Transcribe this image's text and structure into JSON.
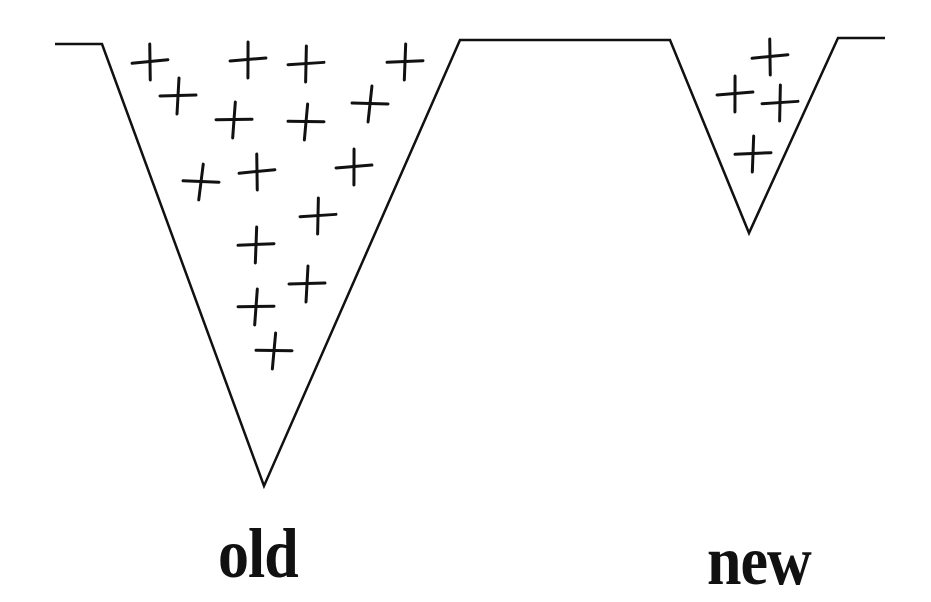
{
  "diagram": {
    "stroke_color": "#111111",
    "outline_points": [
      [
        55,
        44
      ],
      [
        102,
        44
      ],
      [
        264,
        486
      ],
      [
        460,
        40
      ],
      [
        670,
        40
      ],
      [
        749,
        233
      ],
      [
        838,
        38
      ],
      [
        885,
        38
      ]
    ],
    "wells": [
      {
        "name": "old",
        "label": "old",
        "plus_marks": [
          [
            150,
            62
          ],
          [
            248,
            60
          ],
          [
            306,
            64
          ],
          [
            405,
            62
          ],
          [
            178,
            96
          ],
          [
            234,
            120
          ],
          [
            306,
            122
          ],
          [
            370,
            104
          ],
          [
            201,
            182
          ],
          [
            257,
            172
          ],
          [
            354,
            167
          ],
          [
            318,
            216
          ],
          [
            256,
            245
          ],
          [
            307,
            284
          ],
          [
            256,
            307
          ],
          [
            274,
            351
          ]
        ]
      },
      {
        "name": "new",
        "label": "new",
        "plus_marks": [
          [
            770,
            57
          ],
          [
            735,
            94
          ],
          [
            780,
            103
          ],
          [
            753,
            154
          ]
        ]
      }
    ]
  },
  "labels": {
    "old": "old",
    "new": "new"
  }
}
